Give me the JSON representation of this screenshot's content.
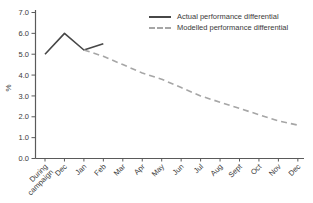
{
  "chart_data": {
    "type": "line",
    "title": "",
    "xlabel": "",
    "ylabel": "%",
    "ylim": [
      0.0,
      7.0
    ],
    "grid": false,
    "legend_position": "top-right",
    "yticks": [
      0,
      1,
      2,
      3,
      4,
      5,
      6,
      7
    ],
    "ytick_labels": [
      "0.0",
      "1.0",
      "2.0",
      "3.0",
      "4.0",
      "5.0",
      "6.0",
      "7.0"
    ],
    "categories": [
      "During campaign",
      "Dec",
      "Jan",
      "Feb",
      "Mar",
      "Apr",
      "May",
      "Jun",
      "Jul",
      "Aug",
      "Sept",
      "Oct",
      "Nov",
      "Dec"
    ],
    "series": [
      {
        "name": "Actual performance differential",
        "line_style": "solid",
        "color": "#474747",
        "x": [
          0,
          1,
          2,
          3
        ],
        "values": [
          5.0,
          6.0,
          5.2,
          5.5
        ]
      },
      {
        "name": "Modelled performance differential",
        "line_style": "dashed",
        "color": "#a6a6a6",
        "x": [
          2,
          3,
          4,
          5,
          6,
          7,
          8,
          9,
          10,
          11,
          12,
          13
        ],
        "values": [
          5.2,
          4.9,
          4.5,
          4.1,
          3.8,
          3.4,
          3.0,
          2.7,
          2.4,
          2.1,
          1.8,
          1.6
        ]
      }
    ]
  }
}
